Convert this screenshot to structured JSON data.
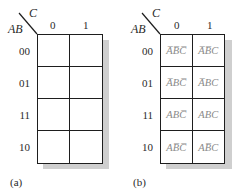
{
  "figure": {
    "maps": [
      {
        "id": "a",
        "caption": "(a)",
        "row_variable": "AB",
        "col_variable": "C",
        "col_labels": [
          "0",
          "1"
        ],
        "row_labels": [
          "00",
          "01",
          "11",
          "10"
        ],
        "cells": [
          [
            "",
            ""
          ],
          [
            "",
            ""
          ],
          [
            "",
            ""
          ],
          [
            "",
            ""
          ]
        ]
      },
      {
        "id": "b",
        "caption": "(b)",
        "row_variable": "AB",
        "col_variable": "C",
        "col_labels": [
          "0",
          "1"
        ],
        "row_labels": [
          "00",
          "01",
          "11",
          "10"
        ],
        "cells": [
          [
            "A̅B̅C̅",
            "A̅B̅C"
          ],
          [
            "A̅BC̅",
            "A̅BC"
          ],
          [
            "ABC̅",
            "ABC"
          ],
          [
            "AB̅C̅",
            "AB̅C"
          ]
        ]
      }
    ],
    "colors": {
      "grid_line": "#1e1e1e",
      "shadow": "#cfcfcf",
      "cell_text": "#8a8a8a",
      "label_text": "#2a2a2a"
    }
  }
}
